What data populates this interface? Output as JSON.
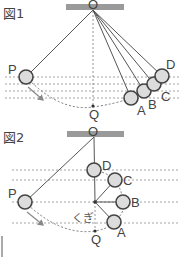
{
  "figure1": {
    "title": "図1",
    "pivot_label": "O",
    "start_label": "P",
    "bottom_label": "Q",
    "positions": [
      {
        "label": "A"
      },
      {
        "label": "B"
      },
      {
        "label": "C"
      },
      {
        "label": "D"
      }
    ]
  },
  "figure2": {
    "title": "図2",
    "pivot_label": "O",
    "start_label": "P",
    "bottom_label": "Q",
    "nail_label": "くぎ",
    "positions": [
      {
        "label": "A"
      },
      {
        "label": "B"
      },
      {
        "label": "C"
      },
      {
        "label": "D"
      }
    ]
  },
  "colors": {
    "ball_fill": "#dcdcdc",
    "ball_stroke": "#444444",
    "ceiling": "#9a9a9a",
    "dashed": "#9a9a9a"
  }
}
